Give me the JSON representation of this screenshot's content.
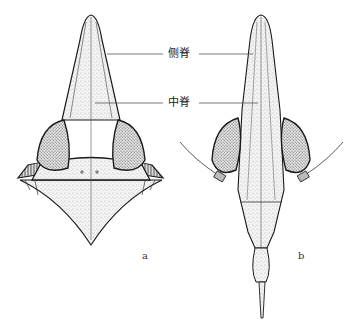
{
  "figure": {
    "panels": [
      {
        "id": "a",
        "label": "a",
        "view": "dorsal view, head with broad lateral lobes and triangular posterior"
      },
      {
        "id": "b",
        "label": "b",
        "view": "dorsal view, elongate head with tapering abdomen and stylus"
      }
    ],
    "annotations": [
      {
        "text": "侧脊",
        "meaning": "lateral ridge"
      },
      {
        "text": "中脊",
        "meaning": "median ridge"
      }
    ],
    "colors": {
      "ink": "#1a1a1a",
      "stipple": "#8a8a8a",
      "background": "#ffffff"
    }
  }
}
